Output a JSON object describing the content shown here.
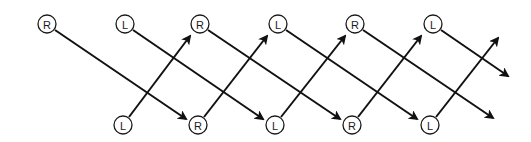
{
  "diagram": {
    "colors": {
      "stroke": "#111111",
      "node_fill": "#ffffff",
      "text": "#1a1a1a"
    },
    "node_radius": 9,
    "nodes": [
      {
        "id": "t0",
        "label": "R",
        "x": 47,
        "y": 24
      },
      {
        "id": "t1",
        "label": "L",
        "x": 125,
        "y": 24
      },
      {
        "id": "t2",
        "label": "R",
        "x": 200,
        "y": 24
      },
      {
        "id": "t3",
        "label": "L",
        "x": 278,
        "y": 24
      },
      {
        "id": "t4",
        "label": "R",
        "x": 355,
        "y": 24
      },
      {
        "id": "t5",
        "label": "L",
        "x": 433,
        "y": 24
      },
      {
        "id": "b0",
        "label": "L",
        "x": 123,
        "y": 125
      },
      {
        "id": "b1",
        "label": "R",
        "x": 198,
        "y": 125
      },
      {
        "id": "b2",
        "label": "L",
        "x": 275,
        "y": 125
      },
      {
        "id": "b3",
        "label": "R",
        "x": 352,
        "y": 125
      },
      {
        "id": "b4",
        "label": "L",
        "x": 430,
        "y": 125
      }
    ],
    "edges": [
      {
        "from": [
          55,
          30
        ],
        "to": [
          186,
          119
        ],
        "direction": "down-right"
      },
      {
        "from": [
          133,
          30
        ],
        "to": [
          263,
          119
        ],
        "direction": "down-right"
      },
      {
        "from": [
          208,
          30
        ],
        "to": [
          340,
          119
        ],
        "direction": "down-right"
      },
      {
        "from": [
          286,
          30
        ],
        "to": [
          417,
          119
        ],
        "direction": "down-right"
      },
      {
        "from": [
          363,
          30
        ],
        "to": [
          493,
          118
        ],
        "direction": "down-right"
      },
      {
        "from": [
          441,
          30
        ],
        "to": [
          508,
          76
        ],
        "direction": "down-right"
      },
      {
        "from": [
          129,
          117
        ],
        "to": [
          190,
          36
        ],
        "direction": "up-right"
      },
      {
        "from": [
          204,
          117
        ],
        "to": [
          267,
          36
        ],
        "direction": "up-right"
      },
      {
        "from": [
          281,
          117
        ],
        "to": [
          345,
          36
        ],
        "direction": "up-right"
      },
      {
        "from": [
          358,
          117
        ],
        "to": [
          421,
          36
        ],
        "direction": "up-right"
      },
      {
        "from": [
          436,
          117
        ],
        "to": [
          498,
          38
        ],
        "direction": "up-right"
      }
    ]
  }
}
